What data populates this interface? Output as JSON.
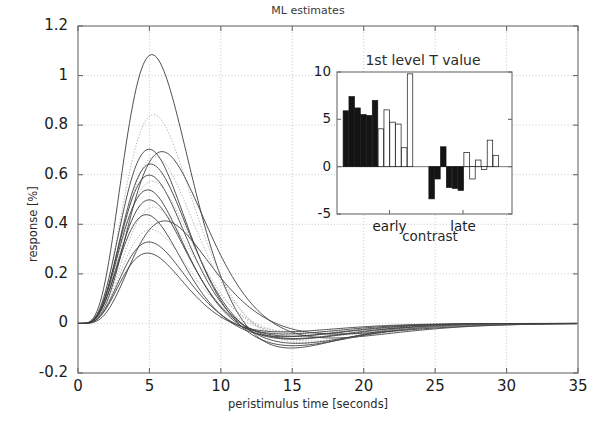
{
  "figure": {
    "title": "ML estimates",
    "width": 616,
    "height": 422
  },
  "main_axes": {
    "xlabel": "peristimulus time [seconds]",
    "ylabel": "response [%]",
    "xticks": [
      "0",
      "5",
      "10",
      "15",
      "20",
      "25",
      "30",
      "35"
    ],
    "yticks": [
      "1.2",
      "1",
      "0.8",
      "0.6",
      "0.4",
      "0.2",
      "0",
      "-0.2"
    ]
  },
  "inset_axes": {
    "title": "1st level T value",
    "xlabel": "contrast",
    "yticks": [
      "10",
      "5",
      "0",
      "-5"
    ],
    "xticks": [
      "early",
      "late"
    ]
  },
  "chart_data": [
    {
      "type": "line",
      "title": "ML estimates",
      "xlabel": "peristimulus time [seconds]",
      "ylabel": "response [%]",
      "xlim": [
        0,
        35
      ],
      "ylim": [
        -0.2,
        1.2
      ],
      "xticks": [
        0,
        5,
        10,
        15,
        20,
        25,
        30,
        35
      ],
      "yticks": [
        -0.2,
        0,
        0.2,
        0.4,
        0.6,
        0.8,
        1.0,
        1.2
      ],
      "grid": true,
      "legend": "none",
      "description": "Overlaid haemodynamic response function estimates; peaks near 5 s, undershoot near 14-18 s, return to baseline by 30 s.",
      "series": [
        {
          "name": "curve-01",
          "style": "solid",
          "peak_time": 5.2,
          "peak": 1.09,
          "undershoot_time": 13.0,
          "undershoot": -0.13
        },
        {
          "name": "curve-02",
          "style": "dotted",
          "peak_time": 5.3,
          "peak": 0.845,
          "undershoot_time": 14.5,
          "undershoot": -0.09
        },
        {
          "name": "curve-03",
          "style": "solid",
          "peak_time": 5.0,
          "peak": 0.705,
          "undershoot_time": 14.0,
          "undershoot": -0.1
        },
        {
          "name": "curve-04",
          "style": "solid",
          "peak_time": 5.9,
          "peak": 0.695,
          "undershoot_time": 16.0,
          "undershoot": -0.07
        },
        {
          "name": "curve-05",
          "style": "dotted",
          "peak_time": 5.4,
          "peak": 0.675,
          "undershoot_time": 15.0,
          "undershoot": -0.08
        },
        {
          "name": "curve-06",
          "style": "solid",
          "peak_time": 5.1,
          "peak": 0.645,
          "undershoot_time": 14.2,
          "undershoot": -0.09
        },
        {
          "name": "curve-07",
          "style": "solid",
          "peak_time": 5.0,
          "peak": 0.6,
          "undershoot_time": 13.8,
          "undershoot": -0.07
        },
        {
          "name": "curve-08",
          "style": "dotted",
          "peak_time": 5.2,
          "peak": 0.575,
          "undershoot_time": 15.2,
          "undershoot": -0.06
        },
        {
          "name": "curve-09",
          "style": "solid",
          "peak_time": 4.9,
          "peak": 0.54,
          "undershoot_time": 14.0,
          "undershoot": -0.07
        },
        {
          "name": "curve-10",
          "style": "solid",
          "peak_time": 5.0,
          "peak": 0.5,
          "undershoot_time": 13.6,
          "undershoot": -0.06
        },
        {
          "name": "curve-11",
          "style": "dotted",
          "peak_time": 5.3,
          "peak": 0.47,
          "undershoot_time": 15.5,
          "undershoot": -0.05
        },
        {
          "name": "curve-12",
          "style": "solid",
          "peak_time": 4.8,
          "peak": 0.44,
          "undershoot_time": 13.4,
          "undershoot": -0.06
        },
        {
          "name": "curve-13",
          "style": "solid",
          "peak_time": 6.1,
          "peak": 0.415,
          "undershoot_time": 16.5,
          "undershoot": -0.05
        },
        {
          "name": "curve-14",
          "style": "dotted",
          "peak_time": 5.1,
          "peak": 0.38,
          "undershoot_time": 14.8,
          "undershoot": -0.04
        },
        {
          "name": "curve-15",
          "style": "solid",
          "peak_time": 5.0,
          "peak": 0.33,
          "undershoot_time": 13.2,
          "undershoot": -0.05
        },
        {
          "name": "curve-16",
          "style": "solid",
          "peak_time": 4.9,
          "peak": 0.285,
          "undershoot_time": 13.0,
          "undershoot": -0.04
        }
      ]
    },
    {
      "type": "bar",
      "title": "1st level T value",
      "xlabel": "contrast",
      "ylabel": "",
      "ylim": [
        -5,
        10
      ],
      "yticks": [
        -5,
        0,
        5,
        10
      ],
      "categories": [
        "early",
        "late"
      ],
      "grid": false,
      "legend": "none",
      "groups": [
        {
          "name": "early",
          "bars": [
            {
              "value": 5.9,
              "fill": "black"
            },
            {
              "value": 7.4,
              "fill": "black"
            },
            {
              "value": 6.2,
              "fill": "black"
            },
            {
              "value": 5.5,
              "fill": "black"
            },
            {
              "value": 5.4,
              "fill": "black"
            },
            {
              "value": 7.0,
              "fill": "black"
            },
            {
              "value": 4.0,
              "fill": "white"
            },
            {
              "value": 6.0,
              "fill": "white"
            },
            {
              "value": 4.7,
              "fill": "white"
            },
            {
              "value": 4.5,
              "fill": "white"
            },
            {
              "value": 2.0,
              "fill": "white"
            },
            {
              "value": 9.8,
              "fill": "white"
            }
          ]
        },
        {
          "name": "late",
          "bars": [
            {
              "value": -3.4,
              "fill": "black"
            },
            {
              "value": -1.3,
              "fill": "black"
            },
            {
              "value": 2.1,
              "fill": "black"
            },
            {
              "value": -2.2,
              "fill": "black"
            },
            {
              "value": -2.3,
              "fill": "black"
            },
            {
              "value": -2.5,
              "fill": "black"
            },
            {
              "value": 1.5,
              "fill": "white"
            },
            {
              "value": -1.3,
              "fill": "white"
            },
            {
              "value": 0.7,
              "fill": "white"
            },
            {
              "value": -0.3,
              "fill": "white"
            },
            {
              "value": 2.8,
              "fill": "white"
            },
            {
              "value": 1.2,
              "fill": "white"
            }
          ]
        }
      ]
    }
  ]
}
